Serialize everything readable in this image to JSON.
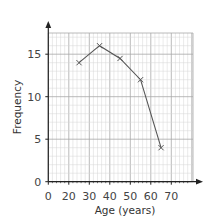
{
  "chart_data": {
    "type": "line",
    "title": "",
    "xlabel": "Age (years)",
    "ylabel": "Frequency",
    "x": [
      25,
      35,
      45,
      55,
      65
    ],
    "series": [
      {
        "name": "Frequency polygon",
        "values": [
          14,
          16,
          14.5,
          12,
          4
        ],
        "marker": "x"
      }
    ],
    "x_ticks": [
      "0",
      "20",
      "30",
      "40",
      "50",
      "60",
      "70"
    ],
    "y_ticks": [
      "0",
      "5",
      "10",
      "15"
    ],
    "xlim": [
      0,
      80
    ],
    "ylim": [
      0,
      17.5
    ],
    "x_axis_break": "0 to 20 compressed into one 10-unit interval",
    "grid": true,
    "legend": "none",
    "colors": {
      "line": "#555555",
      "axis": "#222222",
      "grid_minor": "#d4d4d4",
      "grid_major": "#a8a8a8"
    }
  }
}
